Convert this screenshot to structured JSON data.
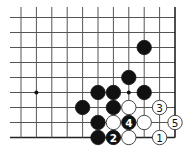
{
  "board": {
    "columns": 11,
    "rows": 9,
    "origin_x": 21,
    "origin_y": 17.5,
    "spacing_x": 15.4,
    "spacing_y": 15,
    "line_extend_left": 10,
    "line_extend_top": 7,
    "edges": [
      "right",
      "bottom"
    ],
    "stone_radius": 7.2,
    "colors": {
      "line": "#555555",
      "edge": "#222222",
      "black_stone": "#111111",
      "white_stone": "#ffffff"
    }
  },
  "star_points": [
    {
      "col": 1,
      "row": 5
    },
    {
      "col": 7,
      "row": 5
    }
  ],
  "stones": [
    {
      "color": "black",
      "col": 8,
      "row": 2,
      "label": ""
    },
    {
      "color": "black",
      "col": 7,
      "row": 4,
      "label": ""
    },
    {
      "color": "black",
      "col": 5,
      "row": 5,
      "label": ""
    },
    {
      "color": "black",
      "col": 6,
      "row": 5,
      "label": ""
    },
    {
      "color": "black",
      "col": 8,
      "row": 5,
      "label": ""
    },
    {
      "color": "black",
      "col": 4,
      "row": 6,
      "label": ""
    },
    {
      "color": "black",
      "col": 6,
      "row": 6,
      "label": ""
    },
    {
      "color": "white",
      "col": 7,
      "row": 6,
      "label": ""
    },
    {
      "color": "white",
      "col": 9,
      "row": 6,
      "label": "3"
    },
    {
      "color": "black",
      "col": 5,
      "row": 7,
      "label": ""
    },
    {
      "color": "white",
      "col": 6,
      "row": 7,
      "label": ""
    },
    {
      "color": "black",
      "col": 7,
      "row": 7,
      "label": "4"
    },
    {
      "color": "white",
      "col": 8,
      "row": 7,
      "label": ""
    },
    {
      "color": "white",
      "col": 10,
      "row": 7,
      "label": "5"
    },
    {
      "color": "black",
      "col": 5,
      "row": 8,
      "label": ""
    },
    {
      "color": "black",
      "col": 6,
      "row": 8,
      "label": "2"
    },
    {
      "color": "white",
      "col": 7,
      "row": 8,
      "label": ""
    },
    {
      "color": "white",
      "col": 9,
      "row": 8,
      "label": "1"
    }
  ]
}
